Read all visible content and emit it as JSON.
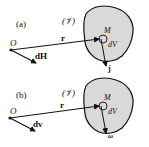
{
  "panels": [
    {
      "id": "a",
      "label": "(a)",
      "volume_label": "(𝒱)",
      "origin_label": "O",
      "position_vector_label": "r",
      "point_label": "M",
      "element_label": "dV",
      "origin_vector_label": "dH",
      "point_vector_label": "j"
    },
    {
      "id": "b",
      "label": "(b)",
      "volume_label": "(𝒱)",
      "origin_label": "O",
      "position_vector_label": "r",
      "point_label": "M",
      "element_label": "dV",
      "origin_vector_label": "dv",
      "point_vector_label": "ω"
    }
  ],
  "colors": {
    "volume_fill": "#d9d9d9",
    "ink": "#111111"
  }
}
